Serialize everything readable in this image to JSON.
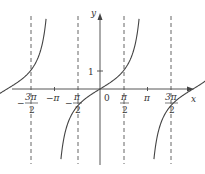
{
  "chart_data": {
    "type": "line",
    "title": "",
    "function": "y = tan x",
    "xlabel": "x",
    "ylabel": "y",
    "xlim": [
      -5.3,
      5.4
    ],
    "ylim": [
      -4.0,
      4.1
    ],
    "x_ticks": [
      {
        "value": -4.712,
        "label_num": "3π",
        "label_den": "2",
        "sign": "−"
      },
      {
        "value": -3.1416,
        "label": "−π"
      },
      {
        "value": -1.5708,
        "label_num": "π",
        "label_den": "2",
        "sign": "−"
      },
      {
        "value": 0,
        "label": "0"
      },
      {
        "value": 1.5708,
        "label_num": "π",
        "label_den": "2",
        "sign": ""
      },
      {
        "value": 3.1416,
        "label": "π"
      },
      {
        "value": 4.712,
        "label_num": "3π",
        "label_den": "2",
        "sign": ""
      }
    ],
    "y_ticks": [
      {
        "value": 1,
        "label": "1"
      }
    ],
    "asymptotes": [
      -4.712,
      -1.5708,
      1.5708,
      4.712
    ],
    "series": [
      {
        "name": "branch (-3π/2, -π/2)",
        "x_range": [
          -4.712,
          -1.5708
        ]
      },
      {
        "name": "branch (-π/2, π/2)",
        "x_range": [
          -1.5708,
          1.5708
        ]
      },
      {
        "name": "branch (π/2, 3π/2)",
        "x_range": [
          1.5708,
          4.712
        ]
      }
    ],
    "grid": false,
    "legend": null
  },
  "labels": {
    "x_axis": "x",
    "y_axis": "y",
    "origin": "0",
    "y_one": "1",
    "neg_pi": "−π",
    "pi": "π",
    "pi_num": "π",
    "three_pi_num": "3π",
    "den": "2",
    "minus": "−"
  }
}
